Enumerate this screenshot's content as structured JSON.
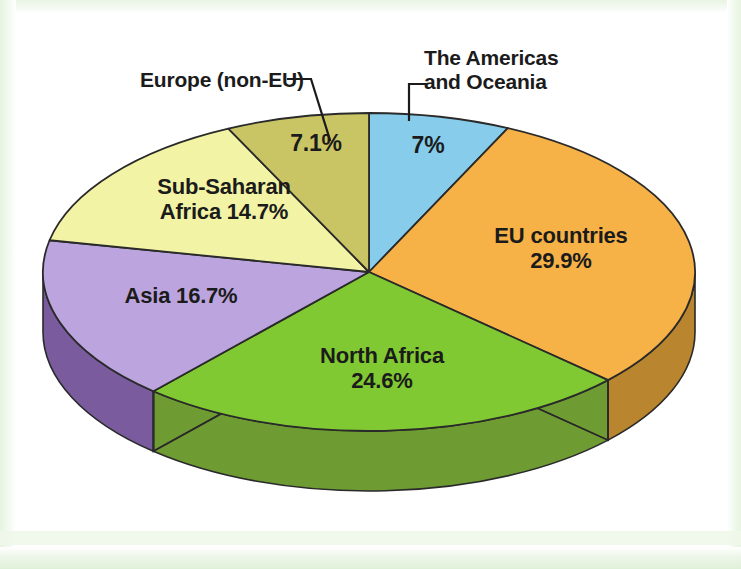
{
  "figure": {
    "background_color": "#ffffff",
    "frame_color": "#e3f3dd"
  },
  "chart_data": {
    "type": "pie",
    "title": "",
    "subtitle": "",
    "xlabel": "",
    "ylabel": "",
    "legend_position": "none",
    "grid": false,
    "three_d": true,
    "start_angle_deg": 0,
    "direction": "clockwise",
    "units": "percent",
    "categories": [
      "The Americas and Oceania",
      "EU countries",
      "North Africa",
      "Asia",
      "Sub-Saharan Africa",
      "Europe (non-EU)"
    ],
    "values": [
      7,
      29.9,
      24.6,
      16.7,
      14.7,
      7.1
    ],
    "value_labels": [
      "7%",
      "29.9%",
      "24.6%",
      "16.7%",
      "14.7%",
      "7.1%"
    ],
    "colors": [
      "#87cdeb",
      "#f6b247",
      "#81c932",
      "#bca5de",
      "#f2f3a4",
      "#c9c565"
    ],
    "side_colors": [
      "#5d9bb5",
      "#b9862f",
      "#6e9c33",
      "#7a5b9e",
      "#c3c37c",
      "#9b9945"
    ],
    "slices": [
      {
        "name": "The Americas and Oceania",
        "value": 7,
        "value_label": "7%",
        "color": "#87cdeb",
        "side_color": "#5d9bb5",
        "label_text": "The Americas\nand Oceania",
        "label_style": "callout"
      },
      {
        "name": "EU countries",
        "value": 29.9,
        "value_label": "29.9%",
        "color": "#f6b247",
        "side_color": "#b9862f",
        "label_text": "EU countries\n29.9%",
        "label_style": "inside"
      },
      {
        "name": "North Africa",
        "value": 24.6,
        "value_label": "24.6%",
        "color": "#81c932",
        "side_color": "#6e9c33",
        "label_text": "North Africa\n24.6%",
        "label_style": "inside"
      },
      {
        "name": "Asia",
        "value": 16.7,
        "value_label": "16.7%",
        "color": "#bca5de",
        "side_color": "#7a5b9e",
        "label_text": "Asia 16.7%",
        "label_style": "inside"
      },
      {
        "name": "Sub-Saharan Africa",
        "value": 14.7,
        "value_label": "14.7%",
        "color": "#f2f3a4",
        "side_color": "#c3c37c",
        "label_text": "Sub-Saharan\nAfrica 14.7%",
        "label_style": "inside"
      },
      {
        "name": "Europe (non-EU)",
        "value": 7.1,
        "value_label": "7.1%",
        "color": "#c9c565",
        "side_color": "#9b9945",
        "label_text": "Europe (non-EU)",
        "label_style": "callout"
      }
    ],
    "callouts": [
      {
        "name": "The Americas and Oceania",
        "text": "The Americas\nand Oceania"
      },
      {
        "name": "Europe (non-EU)",
        "text": "Europe (non-EU)"
      }
    ],
    "inside_labels": {
      "europe_non_eu_pct": "7.1%",
      "americas_pct": "7%",
      "eu_countries": "EU countries\n29.9%",
      "north_africa": "North Africa\n24.6%",
      "asia": "Asia 16.7%",
      "sub_saharan_africa": "Sub-Saharan\nAfrica 14.7%"
    }
  }
}
